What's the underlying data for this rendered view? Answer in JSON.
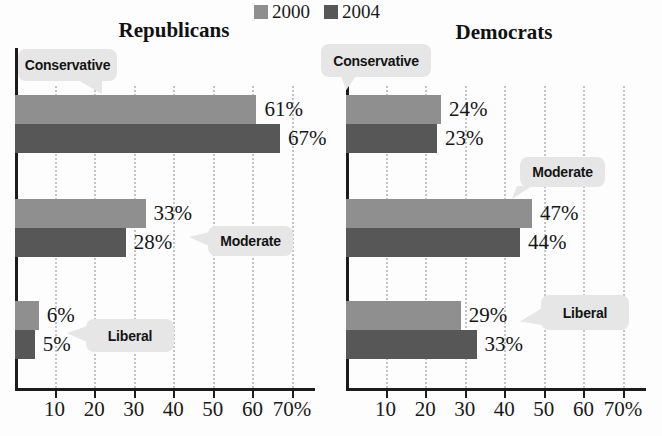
{
  "figure": {
    "background": "#fdfdfd"
  },
  "legend": {
    "items": [
      {
        "label": "2000",
        "color": "#8f8f8f"
      },
      {
        "label": "2004",
        "color": "#575757"
      }
    ]
  },
  "chart_data": [
    {
      "type": "bar",
      "orientation": "horizontal",
      "title": "Republicans",
      "categories": [
        "Conservative",
        "Moderate",
        "Liberal"
      ],
      "series": [
        {
          "name": "2000",
          "values": [
            61,
            33,
            6
          ]
        },
        {
          "name": "2004",
          "values": [
            67,
            28,
            5
          ]
        }
      ],
      "value_label_suffix": "%",
      "xlim": [
        0,
        75
      ],
      "xticks": [
        10,
        20,
        30,
        40,
        50,
        60,
        70
      ],
      "xtick_labels": [
        "10",
        "20",
        "30",
        "40",
        "50",
        "60",
        "70%"
      ],
      "grid": "dotted-vertical",
      "legend_position": "top-center"
    },
    {
      "type": "bar",
      "orientation": "horizontal",
      "title": "Democrats",
      "categories": [
        "Conservative",
        "Moderate",
        "Liberal"
      ],
      "series": [
        {
          "name": "2000",
          "values": [
            24,
            47,
            29
          ]
        },
        {
          "name": "2004",
          "values": [
            23,
            44,
            33
          ]
        }
      ],
      "value_label_suffix": "%",
      "xlim": [
        0,
        75
      ],
      "xticks": [
        10,
        20,
        30,
        40,
        50,
        60,
        70
      ],
      "xtick_labels": [
        "10",
        "20",
        "30",
        "40",
        "50",
        "60",
        "70%"
      ],
      "grid": "dotted-vertical",
      "legend_position": "top-center"
    }
  ]
}
